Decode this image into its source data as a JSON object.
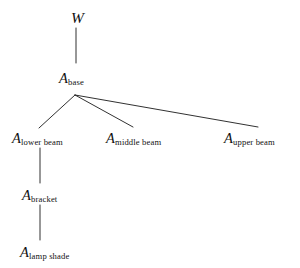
{
  "diagram": {
    "type": "tree",
    "background_color": "#ffffff",
    "line_color": "#1a1a1a",
    "text_color": "#111111"
  },
  "nodes": {
    "root": {
      "symbol": "W",
      "subscript": ""
    },
    "base": {
      "symbol": "A",
      "subscript": "base"
    },
    "lower_beam": {
      "symbol": "A",
      "subscript": "lower beam"
    },
    "middle_beam": {
      "symbol": "A",
      "subscript": "middle beam"
    },
    "upper_beam": {
      "symbol": "A",
      "subscript": "upper beam"
    },
    "bracket": {
      "symbol": "A",
      "subscript": "bracket"
    },
    "lamp_shade": {
      "symbol": "A",
      "subscript": "lamp shade"
    }
  },
  "edges": [
    {
      "from": "root",
      "to": "base",
      "x1": 76,
      "y1": 28,
      "x2": 76,
      "y2": 63
    },
    {
      "from": "base",
      "to": "lower_beam",
      "x1": 75,
      "y1": 95,
      "x2": 39,
      "y2": 128
    },
    {
      "from": "base",
      "to": "middle_beam",
      "x1": 75,
      "y1": 95,
      "x2": 133,
      "y2": 127
    },
    {
      "from": "base",
      "to": "upper_beam",
      "x1": 75,
      "y1": 95,
      "x2": 258,
      "y2": 127
    },
    {
      "from": "lower_beam",
      "to": "bracket",
      "x1": 40,
      "y1": 148,
      "x2": 40,
      "y2": 183
    },
    {
      "from": "bracket",
      "to": "lamp_shade",
      "x1": 40,
      "y1": 205,
      "x2": 40,
      "y2": 240
    }
  ]
}
